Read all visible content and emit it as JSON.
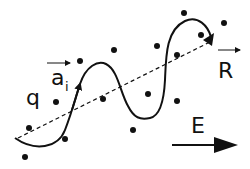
{
  "labels": {
    "q": "q",
    "a": "a",
    "a_sub": "i",
    "R": "R",
    "E": "E"
  },
  "colors": {
    "ink": "#111111",
    "background": "#ffffff"
  },
  "points": [
    [
      80,
      61
    ],
    [
      114,
      50
    ],
    [
      184,
      13
    ],
    [
      224,
      23
    ],
    [
      157,
      46
    ],
    [
      201,
      35
    ],
    [
      177,
      55
    ],
    [
      56,
      102
    ],
    [
      29,
      128
    ],
    [
      65,
      139
    ],
    [
      25,
      157
    ],
    [
      103,
      99
    ],
    [
      148,
      94
    ],
    [
      177,
      101
    ],
    [
      133,
      130
    ]
  ]
}
